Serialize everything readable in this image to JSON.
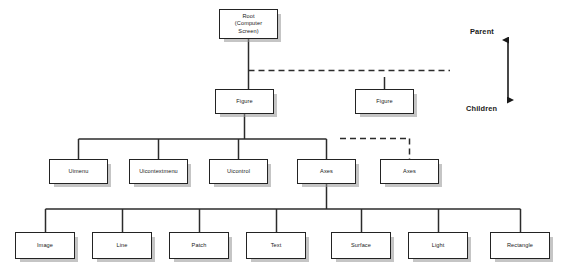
{
  "diagram": {
    "nodes": [
      {
        "id": "root",
        "label": "Root\n(Computer\nScreen)",
        "x": 219,
        "y": 9,
        "w": 59,
        "h": 30
      },
      {
        "id": "figure-1",
        "label": "Figure",
        "x": 215,
        "y": 89,
        "w": 59,
        "h": 25
      },
      {
        "id": "figure-2",
        "label": "Figure",
        "x": 355,
        "y": 89,
        "w": 59,
        "h": 25
      },
      {
        "id": "uimenu",
        "label": "Uimenu",
        "x": 49,
        "y": 159,
        "w": 59,
        "h": 25
      },
      {
        "id": "uicontextmenu",
        "label": "Uicontextmenu",
        "x": 129,
        "y": 159,
        "w": 59,
        "h": 25
      },
      {
        "id": "uicontrol",
        "label": "Uicontrol",
        "x": 209,
        "y": 159,
        "w": 59,
        "h": 25
      },
      {
        "id": "axes-1",
        "label": "Axes",
        "x": 297,
        "y": 159,
        "w": 59,
        "h": 25
      },
      {
        "id": "axes-2",
        "label": "Axes",
        "x": 380,
        "y": 159,
        "w": 59,
        "h": 25
      },
      {
        "id": "image",
        "label": "Image",
        "x": 15,
        "y": 232,
        "w": 60,
        "h": 27
      },
      {
        "id": "line",
        "label": "Line",
        "x": 92,
        "y": 232,
        "w": 60,
        "h": 27
      },
      {
        "id": "patch",
        "label": "Patch",
        "x": 169,
        "y": 232,
        "w": 60,
        "h": 27
      },
      {
        "id": "text",
        "label": "Text",
        "x": 246,
        "y": 232,
        "w": 60,
        "h": 27
      },
      {
        "id": "surface",
        "label": "Surface",
        "x": 331,
        "y": 232,
        "w": 60,
        "h": 27
      },
      {
        "id": "light",
        "label": "Light",
        "x": 408,
        "y": 232,
        "w": 60,
        "h": 27
      },
      {
        "id": "rectangle",
        "label": "Rectangle",
        "x": 490,
        "y": 232,
        "w": 60,
        "h": 27
      }
    ],
    "legend": {
      "parent_label": "Parent",
      "children_label": "Children",
      "parent_x": 470,
      "parent_y": 27,
      "children_x": 466,
      "children_y": 104,
      "arrow_x": 508,
      "arrow_top": 40,
      "arrow_bottom": 100
    },
    "edges": {
      "solid_color": "#2b2b2b",
      "dashed_color": "#2b2b2b",
      "stroke_width": 1.5,
      "dash_pattern": "6,4",
      "solid_paths": [
        "M 248.5 39 L 248.5 89",
        "M 244.5 114 L 244.5 139",
        "M 78.5 139 L 326.5 139",
        "M 78.5 139 L 78.5 159",
        "M 158.5 139 L 158.5 159",
        "M 238.5 139 L 238.5 159",
        "M 326.5 139 L 326.5 159",
        "M 384.5 77 L 384.5 89",
        "M 326.5 184 L 326.5 209",
        "M 45.5 209 L 520.5 209",
        "M 45.5 209 L 45.5 232",
        "M 122.5 209 L 122.5 232",
        "M 199.5 209 L 199.5 232",
        "M 276.5 209 L 276.5 232",
        "M 361.5 209 L 361.5 232",
        "M 438.5 209 L 438.5 232",
        "M 520.5 209 L 520.5 232"
      ],
      "dashed_paths": [
        "M 248.5 70.5 L 450 70.5",
        "M 340 138.5 L 410 138.5",
        "M 409.5 138.5 L 409.5 159"
      ]
    }
  }
}
